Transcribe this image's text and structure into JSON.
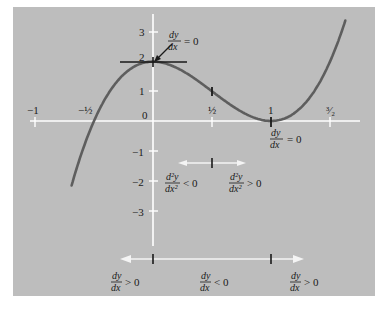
{
  "diagram": {
    "function": "y = 4x^3 - 6x^2 + 2",
    "x_axis": {
      "ticks": [
        {
          "value": -1,
          "label": "−1"
        },
        {
          "value": -0.5,
          "label": "−½"
        },
        {
          "value": 0.5,
          "label": "½"
        },
        {
          "value": 1,
          "label": "1"
        },
        {
          "value": 1.5,
          "label": "³⁄₂"
        }
      ]
    },
    "y_axis": {
      "ticks": [
        {
          "value": 3,
          "label": "3"
        },
        {
          "value": 2,
          "label": "2"
        },
        {
          "value": 1,
          "label": "1"
        },
        {
          "value": 0,
          "label": "0"
        },
        {
          "value": -1,
          "label": "−1"
        },
        {
          "value": -2,
          "label": "−2"
        },
        {
          "value": -3,
          "label": "−3"
        }
      ]
    },
    "annotations": {
      "max_point": {
        "num": "dy",
        "den": "dx",
        "rel": "= 0"
      },
      "min_point": {
        "num": "dy",
        "den": "dx",
        "rel": "= 0"
      },
      "concave_down": {
        "num": "d²y",
        "den": "dx²",
        "rel": "< 0"
      },
      "concave_up": {
        "num": "d²y",
        "den": "dx²",
        "rel": "> 0"
      },
      "increasing_left": {
        "num": "dy",
        "den": "dx",
        "rel": "> 0"
      },
      "decreasing": {
        "num": "dy",
        "den": "dx",
        "rel": "< 0"
      },
      "increasing_right": {
        "num": "dy",
        "den": "dx",
        "rel": "> 0"
      }
    },
    "colors": {
      "background": "#bdbdbd",
      "axes": "#ffffff",
      "curve": "#5e5e5e",
      "ink": "#1a1a1a"
    }
  }
}
